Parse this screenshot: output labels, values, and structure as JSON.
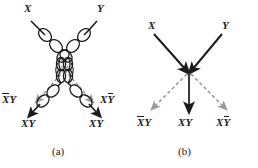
{
  "figure": {
    "background": "#ffffff",
    "ink": "#1c1c1c",
    "gray": "#9a9a9a",
    "panels": [
      {
        "id": "a",
        "caption": "(a)",
        "type": "beaded-chromosome-chiasma",
        "inputs": [
          {
            "name": "parent-x",
            "label": "X"
          },
          {
            "name": "parent-y",
            "label": "Y"
          }
        ],
        "outputs": [
          {
            "name": "recombinant-left",
            "label_plain": "XY",
            "overline": "X",
            "rest": "Y"
          },
          {
            "name": "parental-left",
            "label_plain": "XY",
            "overline": "",
            "rest": "XY"
          },
          {
            "name": "parental-right",
            "label_plain": "XY",
            "overline": "",
            "rest": "XY"
          },
          {
            "name": "recombinant-right",
            "label_plain": "XY",
            "overline": "Y",
            "pre": "X"
          }
        ]
      },
      {
        "id": "b",
        "caption": "(b)",
        "type": "arrow-schematic",
        "inputs": [
          {
            "name": "parent-x",
            "label": "X"
          },
          {
            "name": "parent-y",
            "label": "Y"
          }
        ],
        "outputs": [
          {
            "name": "recombinant-left",
            "label_plain": "XY",
            "overline": "X",
            "rest": "Y"
          },
          {
            "name": "parental-center",
            "label_plain": "XY",
            "overline": "",
            "rest": "XY"
          },
          {
            "name": "recombinant-right",
            "label_plain": "XY",
            "overline": "Y",
            "pre": "X"
          }
        ]
      }
    ],
    "labels": {
      "X": "X",
      "Y": "Y",
      "XY": "XY",
      "X_bar": "X",
      "Y_bar": "Y",
      "caption_a": "(a)",
      "caption_b": "(b)"
    }
  }
}
